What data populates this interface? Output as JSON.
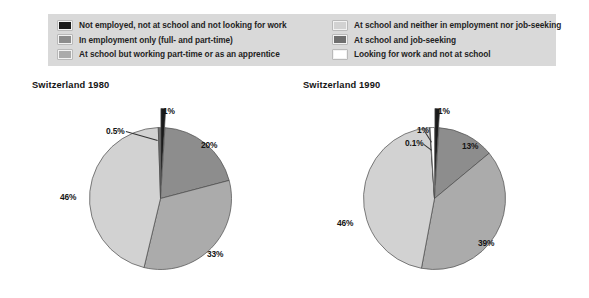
{
  "legend": {
    "columns": [
      {
        "name": "legend-column-left",
        "items": [
          {
            "swatch_color": "#1a1a1a",
            "label": "Not employed, not at school and not looking for work",
            "key": "not-employed-not-school-not-looking"
          },
          {
            "swatch_color": "#8d8d8d",
            "label": "In employment only (full- and part-time)",
            "key": "in-employment-only"
          },
          {
            "swatch_color": "#ababab",
            "label": "At school but working part-time or as an apprentice",
            "key": "at-school-working-part-time"
          }
        ]
      },
      {
        "name": "legend-column-right",
        "items": [
          {
            "swatch_color": "#d2d2d2",
            "label": "At school and neither in employment nor job-seeking",
            "key": "at-school-neither-employed-nor-jobseeking"
          },
          {
            "swatch_color": "#6e6e6e",
            "label": "At school and job-seeking",
            "key": "at-school-job-seeking"
          },
          {
            "swatch_color": "#ffffff",
            "label": "Looking for work and not at school",
            "key": "looking-for-work-not-at-school"
          }
        ]
      }
    ]
  },
  "charts": [
    {
      "id": "1980",
      "title": "Switzerland 1980"
    },
    {
      "id": "1990",
      "title": "Switzerland 1990"
    }
  ],
  "chart_data": [
    {
      "type": "pie",
      "title": "Switzerland 1980",
      "categories": [
        "Not employed, not at school and not looking for work",
        "In employment only (full- and part-time)",
        "At school but working part-time or as an apprentice",
        "At school and neither in employment nor job-seeking",
        "At school and job-seeking",
        "Looking for work and not at school"
      ],
      "values": [
        1,
        20,
        33,
        46,
        0.5,
        0.0
      ],
      "labels": [
        "1%",
        "20%",
        "33%",
        "46%",
        "0.5%",
        ""
      ],
      "colors": [
        "#1a1a1a",
        "#8d8d8d",
        "#ababab",
        "#d2d2d2",
        "#6e6e6e",
        "#ffffff"
      ],
      "exploded": [
        true,
        false,
        false,
        false,
        false,
        false
      ],
      "start_angle_deg": 0,
      "legend_position": "top",
      "grid": false
    },
    {
      "type": "pie",
      "title": "Switzerland 1990",
      "categories": [
        "Not employed, not at school and not looking for work",
        "In employment only (full- and part-time)",
        "At school but working part-time or as an apprentice",
        "At school and neither in employment nor job-seeking",
        "At school and job-seeking",
        "Looking for work and not at school"
      ],
      "values": [
        1,
        13,
        39,
        46,
        0.1,
        1
      ],
      "labels": [
        "1%",
        "13%",
        "39%",
        "46%",
        "0.1%",
        "1%"
      ],
      "colors": [
        "#1a1a1a",
        "#8d8d8d",
        "#ababab",
        "#d2d2d2",
        "#6e6e6e",
        "#ffffff"
      ],
      "exploded": [
        true,
        false,
        false,
        false,
        false,
        false
      ],
      "start_angle_deg": 0,
      "legend_position": "top",
      "grid": false
    }
  ],
  "annotations": {
    "chart_1980": [
      {
        "text": "1%",
        "name": "slice-label-1pct",
        "left": 163,
        "top": 106
      },
      {
        "text": "0.5%",
        "name": "slice-label-0_5pct",
        "left": 106,
        "top": 126
      },
      {
        "text": "20%",
        "name": "slice-label-20pct",
        "left": 201,
        "top": 140
      },
      {
        "text": "33%",
        "name": "slice-label-33pct",
        "left": 207,
        "top": 249
      },
      {
        "text": "46%",
        "name": "slice-label-46pct",
        "left": 60,
        "top": 192
      }
    ],
    "chart_1990": [
      {
        "text": "1%",
        "name": "slice-label-1pct-black",
        "left": 438,
        "top": 106
      },
      {
        "text": "1%",
        "name": "slice-label-1pct-white",
        "left": 417,
        "top": 125
      },
      {
        "text": "0.1%",
        "name": "slice-label-0_1pct",
        "left": 405,
        "top": 138
      },
      {
        "text": "13%",
        "name": "slice-label-13pct",
        "left": 462,
        "top": 141
      },
      {
        "text": "39%",
        "name": "slice-label-39pct",
        "left": 478,
        "top": 238
      },
      {
        "text": "46%",
        "name": "slice-label-46pct",
        "left": 337,
        "top": 218
      }
    ]
  }
}
